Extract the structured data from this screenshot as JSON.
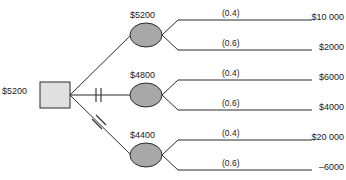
{
  "diagram": {
    "type": "decision-tree",
    "colors": {
      "line": "#2b2b2b",
      "decision_node_fill": "#e0e0e0",
      "chance_node_fill": "#a8a8a8",
      "node_stroke": "#2b2b2b",
      "text": "#1a1a1a",
      "background": "#ffffff"
    },
    "root": {
      "shape": "square",
      "node_kind": "decision",
      "value_label": "$5200"
    },
    "branches": [
      {
        "index": 1,
        "pruned": false,
        "pruned_marks": 0,
        "chance_node": {
          "shape": "ellipse",
          "node_kind": "chance",
          "value_label": "$5200"
        },
        "outcomes": [
          {
            "probability_label": "(0.4)",
            "probability": 0.4,
            "payoff_label": "$10 000",
            "payoff": 10000
          },
          {
            "probability_label": "(0.6)",
            "probability": 0.6,
            "payoff_label": "$2000",
            "payoff": 2000
          }
        ]
      },
      {
        "index": 2,
        "pruned": true,
        "pruned_marks": 2,
        "chance_node": {
          "shape": "ellipse",
          "node_kind": "chance",
          "value_label": "$4800"
        },
        "outcomes": [
          {
            "probability_label": "(0.4)",
            "probability": 0.4,
            "payoff_label": "$6000",
            "payoff": 6000
          },
          {
            "probability_label": "(0.6)",
            "probability": 0.6,
            "payoff_label": "$4000",
            "payoff": 4000
          }
        ]
      },
      {
        "index": 3,
        "pruned": true,
        "pruned_marks": 2,
        "chance_node": {
          "shape": "ellipse",
          "node_kind": "chance",
          "value_label": "$4400"
        },
        "outcomes": [
          {
            "probability_label": "(0.4)",
            "probability": 0.4,
            "payoff_label": "$20 000",
            "payoff": 20000
          },
          {
            "probability_label": "(0.6)",
            "probability": 0.6,
            "payoff_label": "–6000",
            "payoff": -6000
          }
        ]
      }
    ]
  }
}
